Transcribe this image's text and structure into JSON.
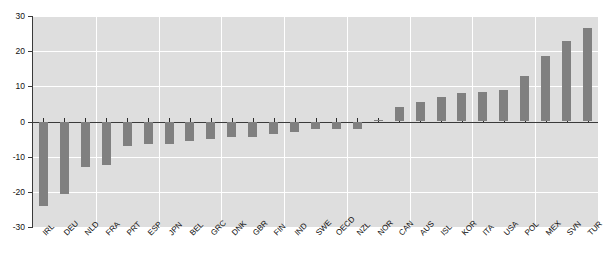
{
  "chart_data": {
    "type": "bar",
    "title": "",
    "subtitle": "",
    "xlabel": "",
    "ylabel": "",
    "ylim": [
      -30,
      30
    ],
    "yticks": [
      30,
      20,
      10,
      0,
      -10,
      -20,
      -30
    ],
    "ytick_labels": [
      "30",
      "20",
      "10",
      "0",
      "-10",
      "-20",
      "-30"
    ],
    "grid": true,
    "grid_orientation": "both",
    "legend": false,
    "legend_position": "none",
    "bar_color": "#808080",
    "plot_background": "#dedede",
    "gridline_color": "#ffffff",
    "axis_color": "#3a3a3a",
    "categories": [
      "IRL",
      "DEU",
      "NLD",
      "FRA",
      "PRT",
      "ESP",
      "JPN",
      "BEL",
      "GRC",
      "DNK",
      "GBR",
      "FIN",
      "IND",
      "SWE",
      "OECD",
      "NZL",
      "NOR",
      "CAN",
      "AUS",
      "ISL",
      "KOR",
      "ITA",
      "USA",
      "POL",
      "MEX",
      "SVN",
      "TUR"
    ],
    "values": [
      -24.0,
      -20.5,
      -13.0,
      -12.5,
      -7.0,
      -6.5,
      -6.5,
      -5.5,
      -5.0,
      -4.5,
      -4.5,
      -3.5,
      -3.0,
      -2.0,
      -2.0,
      -2.0,
      0.3,
      4.0,
      5.5,
      7.0,
      8.0,
      8.5,
      9.0,
      13.0,
      18.5,
      23.0,
      26.5
    ]
  }
}
